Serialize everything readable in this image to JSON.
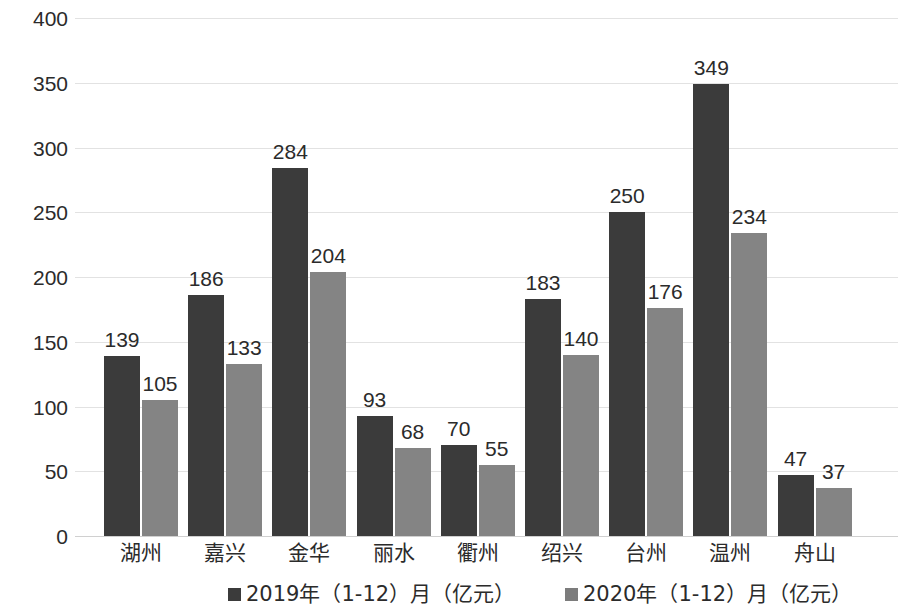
{
  "chart_data": {
    "type": "bar",
    "title": "",
    "subtitle": "",
    "xlabel": "",
    "ylabel": "",
    "ylim": [
      0,
      400
    ],
    "ytick_labels": [
      "400",
      "350",
      "300",
      "250",
      "200",
      "150",
      "100",
      "50",
      "0"
    ],
    "ytick_values": [
      400,
      350,
      300,
      250,
      200,
      150,
      100,
      50,
      0
    ],
    "grid": true,
    "legend_position": "bottom",
    "categories": [
      "湖州",
      "嘉兴",
      "金华",
      "丽水",
      "衢州",
      "绍兴",
      "台州",
      "温州",
      "舟山"
    ],
    "series": [
      {
        "name": "2019年（1-12）月（亿元）",
        "color": "#3b3b3b",
        "values": [
          139,
          186,
          284,
          93,
          70,
          183,
          250,
          349,
          47
        ]
      },
      {
        "name": "2020年（1-12）月（亿元）",
        "color": "#848484",
        "values": [
          105,
          133,
          204,
          68,
          55,
          140,
          176,
          234,
          37
        ]
      }
    ]
  },
  "legend": {
    "items": [
      {
        "label": "2019年（1-12）月（亿元）"
      },
      {
        "label": "2020年（1-12）月（亿元）"
      }
    ]
  }
}
